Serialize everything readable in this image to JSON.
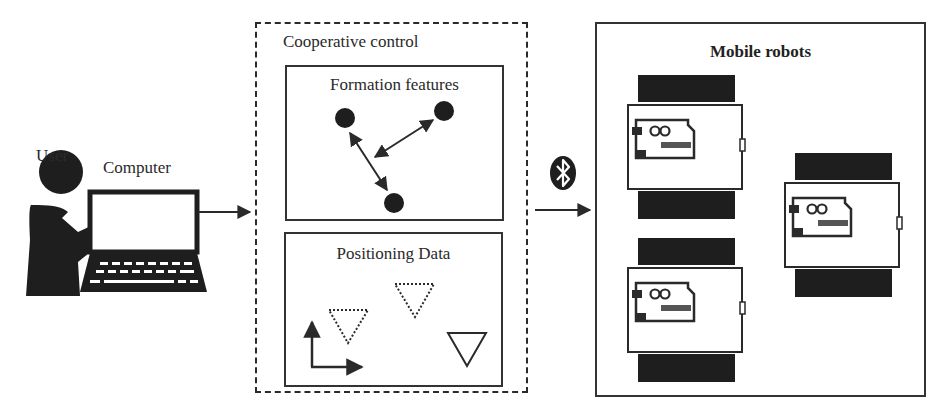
{
  "diagram": {
    "user": {
      "label": "User"
    },
    "computer": {
      "label": "Computer"
    },
    "cooperative_control": {
      "title": "Cooperative control",
      "formation_features": {
        "title": "Formation features",
        "nodes": 3,
        "links": 2
      },
      "positioning_data": {
        "title": "Positioning Data",
        "markers": [
          "dotted-triangle",
          "dotted-triangle",
          "solid-triangle"
        ],
        "axes": "xy-frame"
      }
    },
    "link": {
      "icon": "bluetooth-icon"
    },
    "mobile_robots": {
      "title": "Mobile robots",
      "count": 3,
      "controller_icon": "arduino-infinity-logo"
    },
    "flow": [
      "User",
      "Computer",
      "Cooperative control",
      "Bluetooth",
      "Mobile robots"
    ],
    "colors": {
      "stroke": "#2a2a2a",
      "fill_dark": "#1e1e1e",
      "background": "#ffffff"
    }
  }
}
